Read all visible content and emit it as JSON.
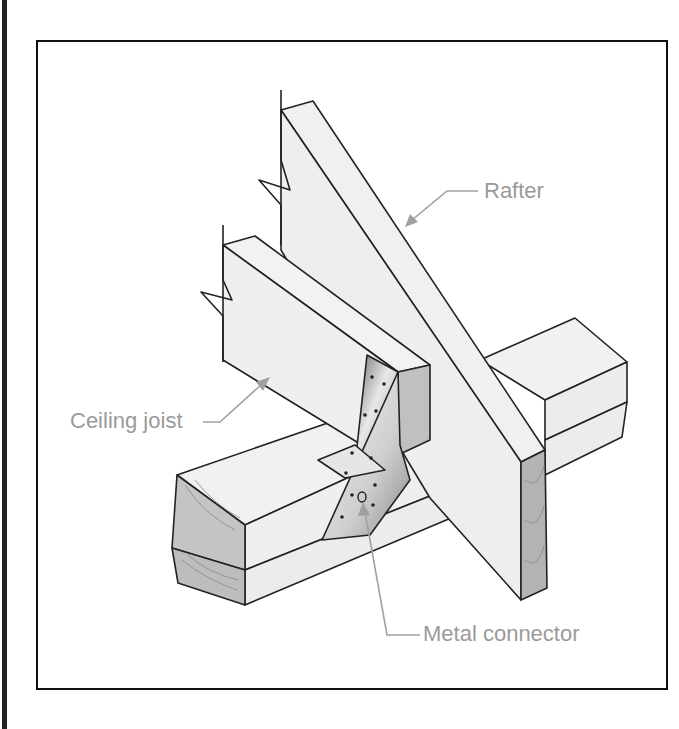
{
  "figure": {
    "labels": {
      "rafter": "Rafter",
      "ceiling_joist": "Ceiling joist",
      "metal_connector": "Metal connector"
    },
    "colors": {
      "frame": "#111111",
      "wood_face": "#efefef",
      "end_grain": "#b8b8b8",
      "label_text": "#9a9a9a",
      "leader": "#a0a0a0"
    }
  }
}
